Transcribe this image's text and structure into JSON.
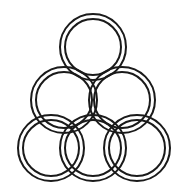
{
  "figure": {
    "background_color": "#ffffff",
    "stroke_color": "#1a1a1a",
    "stroke_width": 2,
    "canvas": {
      "width": 182,
      "height": 192
    },
    "ring_count": 6,
    "outer_radius": 33,
    "inner_radius": 28,
    "rings": [
      {
        "name": "apex-ring",
        "row": "top",
        "cx": 93,
        "cy": 47
      },
      {
        "name": "middle-left-ring",
        "row": "middle",
        "cx": 64,
        "cy": 100
      },
      {
        "name": "middle-right-ring",
        "row": "middle",
        "cx": 122,
        "cy": 100
      },
      {
        "name": "bottom-left-ring",
        "row": "bottom",
        "cx": 51,
        "cy": 148
      },
      {
        "name": "bottom-center-ring",
        "row": "bottom",
        "cx": 93,
        "cy": 148
      },
      {
        "name": "bottom-right-ring",
        "row": "bottom",
        "cx": 137,
        "cy": 148
      }
    ]
  }
}
